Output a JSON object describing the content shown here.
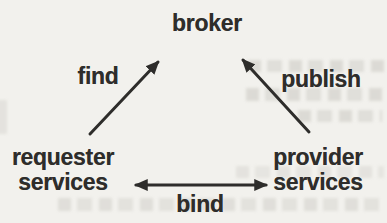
{
  "diagram": {
    "nodes": {
      "broker": {
        "label": "broker"
      },
      "requester": {
        "lines": [
          "requester",
          "services"
        ]
      },
      "provider": {
        "lines": [
          "provider",
          "services"
        ]
      }
    },
    "edges": {
      "find": {
        "label": "find",
        "from": "requester services",
        "to": "broker",
        "bidirectional": false
      },
      "publish": {
        "label": "publish",
        "from": "provider services",
        "to": "broker",
        "bidirectional": false
      },
      "bind": {
        "label": "bind",
        "from": "requester services",
        "to": "provider services",
        "bidirectional": true
      }
    }
  },
  "colors": {
    "ink": "#2e2d2b",
    "background": "#f2f1ed"
  }
}
